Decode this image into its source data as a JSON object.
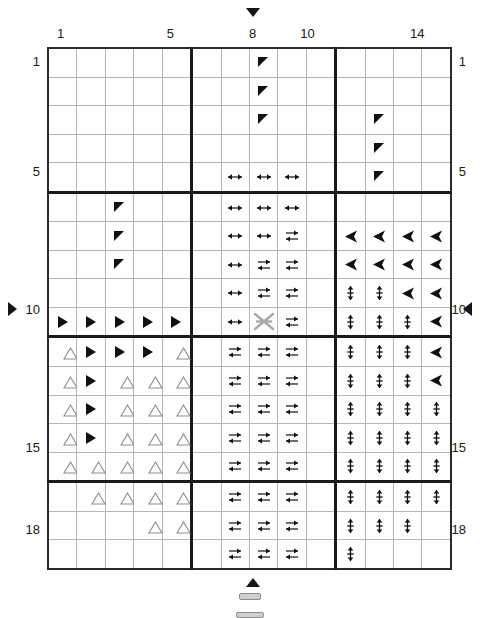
{
  "grid": {
    "columns": 14,
    "rows": 18,
    "column_labels": [
      {
        "value": "1",
        "col": 1
      },
      {
        "value": "5",
        "col": 5
      },
      {
        "value": "8",
        "col": 8
      },
      {
        "value": "10",
        "col": 10
      },
      {
        "value": "14",
        "col": 14
      }
    ],
    "row_labels": [
      {
        "value": "1",
        "row": 1
      },
      {
        "value": "5",
        "row": 5
      },
      {
        "value": "10",
        "row": 10
      },
      {
        "value": "15",
        "row": 15
      },
      {
        "value": "18",
        "row": 18
      }
    ],
    "thick_separator_columns": [
      5,
      10
    ],
    "thick_separator_rows": [
      5,
      10,
      15
    ],
    "cell_size_px": 27,
    "grid_line_color": "#b6b6b6",
    "thick_line_color": "#1a1a1a",
    "symbol_color": "#101010",
    "highlight_color": "#a8a8a8"
  },
  "markers": {
    "top": {
      "icon": "triangle-down-icon",
      "at_column": 8
    },
    "bottom": {
      "icon": "triangle-up-icon",
      "at_column": 8
    },
    "left": {
      "icon": "triangle-right-icon",
      "at_row": 10,
      "label": "10"
    },
    "right": {
      "icon": "triangle-left-icon",
      "at_row": 10,
      "label": "10"
    }
  },
  "legend": {
    "symbols": [
      {
        "key": "flag",
        "name": "corner-flag-icon"
      },
      {
        "key": "play",
        "name": "triangle-right-filled-icon"
      },
      {
        "key": "tri",
        "name": "triangle-up-outline-icon"
      },
      {
        "key": "hh",
        "name": "double-headed-horizontal-arrow-icon"
      },
      {
        "key": "opp",
        "name": "opposing-horizontal-arrows-icon"
      },
      {
        "key": "larrow",
        "name": "arrow-left-filled-icon"
      },
      {
        "key": "vert",
        "name": "vertical-double-arrow-icon"
      },
      {
        "key": "x",
        "name": "bowtie-cross-icon"
      }
    ]
  },
  "cells": [
    [
      "",
      "",
      "",
      "",
      "",
      "",
      "",
      "flag",
      "",
      "",
      "",
      "",
      "",
      ""
    ],
    [
      "",
      "",
      "",
      "",
      "",
      "",
      "",
      "flag",
      "",
      "",
      "",
      "",
      "",
      ""
    ],
    [
      "",
      "",
      "",
      "",
      "",
      "",
      "",
      "flag",
      "",
      "",
      "",
      "flag",
      "",
      ""
    ],
    [
      "",
      "",
      "",
      "",
      "",
      "",
      "",
      "",
      "",
      "",
      "",
      "flag",
      "",
      ""
    ],
    [
      "",
      "",
      "",
      "",
      "",
      "",
      "hh",
      "hh",
      "hh",
      "",
      "",
      "flag",
      "",
      ""
    ],
    [
      "",
      "",
      "flag",
      "",
      "",
      "",
      "hh",
      "hh",
      "hh",
      "",
      "",
      "",
      "",
      ""
    ],
    [
      "",
      "",
      "flag",
      "",
      "",
      "",
      "hh",
      "hh",
      "opp",
      "",
      "larrow",
      "larrow",
      "larrow",
      "larrow"
    ],
    [
      "",
      "",
      "flag",
      "",
      "",
      "",
      "hh",
      "opp",
      "opp",
      "",
      "larrow",
      "larrow",
      "larrow",
      "larrow"
    ],
    [
      "",
      "",
      "",
      "",
      "",
      "",
      "hh",
      "opp",
      "opp",
      "",
      "vert",
      "vert",
      "larrow",
      "larrow"
    ],
    [
      "play",
      "play",
      "play",
      "play",
      "play",
      "",
      "hh",
      "x",
      "opp",
      "",
      "vert",
      "vert",
      "vert",
      "larrow"
    ],
    [
      "tri",
      "play",
      "play",
      "play",
      "tri",
      "",
      "opp",
      "opp",
      "opp",
      "",
      "vert",
      "vert",
      "vert",
      "larrow"
    ],
    [
      "tri",
      "play",
      "tri",
      "tri",
      "tri",
      "",
      "opp",
      "opp",
      "opp",
      "",
      "vert",
      "vert",
      "vert",
      "larrow"
    ],
    [
      "tri",
      "play",
      "tri",
      "tri",
      "tri",
      "",
      "opp",
      "opp",
      "opp",
      "",
      "vert",
      "vert",
      "vert",
      "vert"
    ],
    [
      "tri",
      "play",
      "tri",
      "tri",
      "tri",
      "",
      "opp",
      "opp",
      "opp",
      "",
      "vert",
      "vert",
      "vert",
      "vert"
    ],
    [
      "tri",
      "tri",
      "tri",
      "tri",
      "tri",
      "",
      "opp",
      "opp",
      "opp",
      "",
      "vert",
      "vert",
      "vert",
      "vert"
    ],
    [
      "",
      "tri",
      "tri",
      "tri",
      "tri",
      "",
      "opp",
      "opp",
      "opp",
      "",
      "vert",
      "vert",
      "vert",
      "vert"
    ],
    [
      "",
      "",
      "",
      "tri",
      "tri",
      "",
      "opp",
      "opp",
      "opp",
      "",
      "vert",
      "vert",
      "vert",
      ""
    ],
    [
      "",
      "",
      "",
      "",
      "",
      "",
      "opp",
      "opp",
      "opp",
      "",
      "vert",
      "",
      "",
      ""
    ]
  ]
}
